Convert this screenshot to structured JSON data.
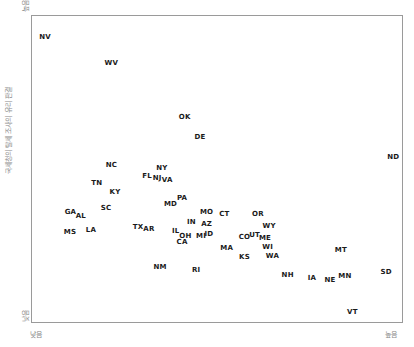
{
  "chart_data": {
    "type": "scatter",
    "title": "",
    "xlabel": "",
    "ylabel": "국세청의 탈세 조사의 유리 판결",
    "x_axis_ends": {
      "low": "낮음",
      "high": "높음"
    },
    "y_axis_ends": {
      "low": "낮음",
      "high": "높음"
    },
    "xlim": [
      0,
      100
    ],
    "ylim": [
      0,
      100
    ],
    "grid": false,
    "legend": null,
    "points": [
      {
        "label": "NV",
        "x": 3.8,
        "y": 92.9
      },
      {
        "label": "WV",
        "x": 21.6,
        "y": 84.4
      },
      {
        "label": "OK",
        "x": 41.3,
        "y": 66.9
      },
      {
        "label": "DE",
        "x": 45.4,
        "y": 60.4
      },
      {
        "label": "ND",
        "x": 97.4,
        "y": 53.9
      },
      {
        "label": "NC",
        "x": 21.6,
        "y": 51.3
      },
      {
        "label": "NY",
        "x": 35.2,
        "y": 50.3
      },
      {
        "label": "FL",
        "x": 31.2,
        "y": 47.7
      },
      {
        "label": "NJ",
        "x": 33.9,
        "y": 47.1
      },
      {
        "label": "VA",
        "x": 36.6,
        "y": 46.4
      },
      {
        "label": "TN",
        "x": 17.7,
        "y": 45.5
      },
      {
        "label": "KY",
        "x": 22.6,
        "y": 42.5
      },
      {
        "label": "PA",
        "x": 40.6,
        "y": 40.6
      },
      {
        "label": "MD",
        "x": 37.5,
        "y": 38.6
      },
      {
        "label": "SC",
        "x": 20.2,
        "y": 37.3
      },
      {
        "label": "GA",
        "x": 10.6,
        "y": 36.0
      },
      {
        "label": "AL",
        "x": 13.4,
        "y": 34.7
      },
      {
        "label": "MO",
        "x": 47.2,
        "y": 36.0
      },
      {
        "label": "CT",
        "x": 52.0,
        "y": 35.4
      },
      {
        "label": "OR",
        "x": 61.0,
        "y": 35.4
      },
      {
        "label": "IN",
        "x": 43.1,
        "y": 32.8
      },
      {
        "label": "AZ",
        "x": 47.2,
        "y": 32.1
      },
      {
        "label": "WY",
        "x": 64.0,
        "y": 31.5
      },
      {
        "label": "TX",
        "x": 28.8,
        "y": 31.2
      },
      {
        "label": "AR",
        "x": 31.7,
        "y": 30.5
      },
      {
        "label": "MS",
        "x": 10.5,
        "y": 29.5
      },
      {
        "label": "LA",
        "x": 16.1,
        "y": 30.2
      },
      {
        "label": "IL",
        "x": 38.9,
        "y": 29.9
      },
      {
        "label": "OH",
        "x": 41.5,
        "y": 28.2
      },
      {
        "label": "MI",
        "x": 45.7,
        "y": 28.2
      },
      {
        "label": "ID",
        "x": 47.8,
        "y": 28.9
      },
      {
        "label": "CO",
        "x": 57.4,
        "y": 27.9
      },
      {
        "label": "UT",
        "x": 60.1,
        "y": 28.6
      },
      {
        "label": "ME",
        "x": 62.9,
        "y": 27.6
      },
      {
        "label": "CA",
        "x": 40.6,
        "y": 26.3
      },
      {
        "label": "MA",
        "x": 52.6,
        "y": 24.4
      },
      {
        "label": "WI",
        "x": 63.6,
        "y": 24.7
      },
      {
        "label": "KS",
        "x": 57.4,
        "y": 21.4
      },
      {
        "label": "WA",
        "x": 64.9,
        "y": 21.8
      },
      {
        "label": "MT",
        "x": 83.3,
        "y": 23.7
      },
      {
        "label": "NM",
        "x": 34.7,
        "y": 18.2
      },
      {
        "label": "RI",
        "x": 44.4,
        "y": 17.2
      },
      {
        "label": "NH",
        "x": 69.0,
        "y": 15.6
      },
      {
        "label": "IA",
        "x": 75.5,
        "y": 14.6
      },
      {
        "label": "NE",
        "x": 80.4,
        "y": 14.0
      },
      {
        "label": "MN",
        "x": 84.4,
        "y": 15.3
      },
      {
        "label": "SD",
        "x": 95.5,
        "y": 16.6
      },
      {
        "label": "VT",
        "x": 86.4,
        "y": 3.6
      }
    ]
  },
  "axes": {
    "y_label": "국세청의 탈세 조사의 유리 판결",
    "y_high": "높음",
    "y_low": "낮음",
    "x_low": "낮음",
    "x_high": "높음",
    "x_label": "················"
  }
}
